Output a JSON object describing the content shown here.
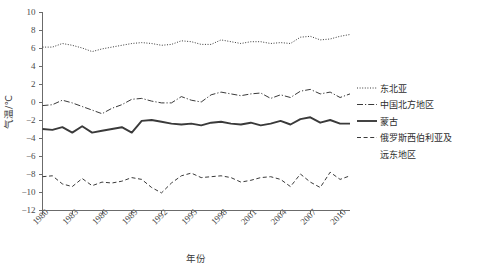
{
  "chart_data": {
    "type": "line",
    "title": "",
    "xlabel": "年份",
    "ylabel": "气温/℃",
    "xlim": [
      1980,
      2011
    ],
    "ylim": [
      -12,
      10
    ],
    "ytick_step": 2,
    "grid": false,
    "legend_position": "right",
    "xticks": [
      "1980",
      "1983",
      "1986",
      "1989",
      "1992",
      "1995",
      "1998",
      "2001",
      "2004",
      "2007",
      "2010"
    ],
    "yticks": [
      "10",
      "8",
      "6",
      "4",
      "2",
      "0",
      "-2",
      "-4",
      "-6",
      "-8",
      "-10",
      "-12"
    ],
    "x": [
      1980,
      1981,
      1982,
      1983,
      1984,
      1985,
      1986,
      1987,
      1988,
      1989,
      1990,
      1991,
      1992,
      1993,
      1994,
      1995,
      1996,
      1997,
      1998,
      1999,
      2000,
      2001,
      2002,
      2003,
      2004,
      2005,
      2006,
      2007,
      2008,
      2009,
      2010,
      2011
    ],
    "series": [
      {
        "name": "东北亚",
        "style": "dotted",
        "color": "#3a3a3a",
        "values": [
          6.1,
          6.1,
          6.5,
          6.3,
          6.0,
          5.6,
          5.9,
          6.1,
          6.3,
          6.5,
          6.6,
          6.5,
          6.3,
          6.4,
          6.8,
          6.7,
          6.4,
          6.4,
          6.9,
          6.7,
          6.5,
          6.7,
          6.7,
          6.5,
          6.6,
          6.5,
          7.2,
          7.3,
          6.9,
          7.0,
          7.3,
          7.5
        ]
      },
      {
        "name": "中国北方地区",
        "style": "dashdot",
        "color": "#3a3a3a",
        "values": [
          -0.4,
          -0.3,
          0.2,
          -0.1,
          -0.5,
          -0.9,
          -1.3,
          -0.7,
          -0.3,
          0.3,
          0.4,
          0.1,
          -0.1,
          -0.1,
          0.6,
          0.2,
          0.0,
          0.8,
          1.1,
          0.9,
          0.7,
          0.9,
          1.0,
          0.4,
          0.8,
          0.5,
          1.2,
          1.4,
          0.9,
          1.1,
          0.5,
          0.9
        ]
      },
      {
        "name": "蒙古",
        "style": "solid",
        "color": "#2a2a2a",
        "values": [
          -3.0,
          -3.1,
          -2.8,
          -3.4,
          -2.7,
          -3.4,
          -3.2,
          -3.0,
          -2.8,
          -3.4,
          -2.1,
          -2.0,
          -2.2,
          -2.4,
          -2.5,
          -2.4,
          -2.6,
          -2.3,
          -2.2,
          -2.4,
          -2.5,
          -2.3,
          -2.6,
          -2.4,
          -2.1,
          -2.5,
          -1.9,
          -1.7,
          -2.3,
          -2.0,
          -2.4,
          -2.4
        ]
      },
      {
        "name": "俄罗斯西伯利亚及远东地区",
        "style": "dashed",
        "color": "#3a3a3a",
        "values": [
          -8.3,
          -8.2,
          -9.1,
          -9.4,
          -8.5,
          -9.3,
          -8.9,
          -9.0,
          -8.8,
          -8.4,
          -8.6,
          -9.5,
          -10.1,
          -9.0,
          -8.2,
          -7.9,
          -8.4,
          -8.3,
          -8.2,
          -8.4,
          -8.9,
          -8.7,
          -8.4,
          -8.3,
          -8.6,
          -9.4,
          -8.0,
          -8.9,
          -9.5,
          -7.8,
          -8.6,
          -8.2
        ]
      }
    ]
  },
  "legend": {
    "items": [
      {
        "label": "东北亚"
      },
      {
        "label": "中国北方地区"
      },
      {
        "label": "蒙古"
      },
      {
        "label": "俄罗斯西伯利亚及"
      },
      {
        "label": "远东地区"
      }
    ]
  }
}
